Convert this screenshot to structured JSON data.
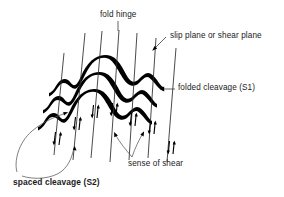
{
  "figure": {
    "background_color": "#ffffff",
    "ink_color": "#000000",
    "width": 284,
    "height": 197
  },
  "labels": {
    "fold_hinge": "fold hinge",
    "slip_plane": "slip plane or shear plane",
    "folded_cleavage": "folded cleavage (S1)",
    "sense_of_shear": "sense of shear",
    "spaced_cleavage": "spaced cleavage (S2)"
  },
  "diagram": {
    "folded_cleavage_bands": 3,
    "slip_plane_lines": 7,
    "shear_arrow_pairs": 7,
    "band_color": "#000000",
    "slip_line_color": "#2b2b2b",
    "leader_color": "#3a3a3a"
  }
}
